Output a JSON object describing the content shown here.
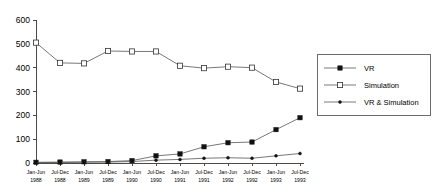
{
  "chart_data": {
    "type": "line",
    "title": "",
    "subtitle": "",
    "xlabel": "",
    "ylabel": "",
    "grid": false,
    "legend_position": "right",
    "ylim": [
      0,
      600
    ],
    "yticks": [
      "0",
      "100",
      "200",
      "300",
      "400",
      "500",
      "600"
    ],
    "categories": [
      "Jan-Jun 1988",
      "Jul-Dec 1988",
      "Jan-Jun 1989",
      "Jul-Dec 1989",
      "Jan-Jun 1990",
      "Jul-Dec 1990",
      "Jan-Jun 1991",
      "Jul-Dec 1991",
      "Jan-Jun 1992",
      "Jul-Dec 1992",
      "Jan-Jun 1993",
      "Jul-Dec 1993"
    ],
    "category_periods": [
      "Jan-Jun",
      "Jul-Dec",
      "Jan-Jun",
      "Jul-Dec",
      "Jan-Jun",
      "Jul-Dec",
      "Jan-Jun",
      "Jul-Dec",
      "Jan-Jun",
      "Jul-Dec",
      "Jan-Jun",
      "Jul-Dec"
    ],
    "category_years": [
      "1988",
      "1988",
      "1989",
      "1989",
      "1990",
      "1990",
      "1991",
      "1991",
      "1992",
      "1992",
      "1993",
      "1993"
    ],
    "series": [
      {
        "name": "VR",
        "marker": "filled-square",
        "values": [
          3,
          4,
          5,
          6,
          10,
          30,
          38,
          68,
          85,
          88,
          140,
          190
        ]
      },
      {
        "name": "Simulation",
        "marker": "open-square",
        "values": [
          505,
          420,
          418,
          470,
          468,
          468,
          408,
          398,
          404,
          400,
          340,
          312
        ]
      },
      {
        "name": "VR & Simulation",
        "marker": "dot",
        "values": [
          2,
          2,
          3,
          4,
          6,
          12,
          15,
          20,
          22,
          20,
          30,
          40
        ]
      }
    ]
  },
  "legend": {
    "entries": [
      {
        "label": "VR"
      },
      {
        "label": "Simulation"
      },
      {
        "label": "VR & Simulation"
      }
    ]
  },
  "colors": {
    "line": "#555555",
    "marker_fill": "#111111",
    "marker_open": "#ffffff",
    "axis": "#4a4a4a",
    "background": "#ffffff"
  }
}
